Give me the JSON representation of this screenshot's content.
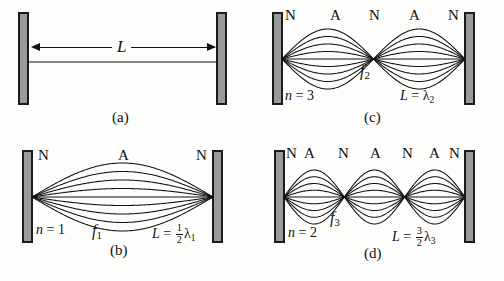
{
  "figure": {
    "background_color": "#fdfdfb",
    "wall_fill_color": "#9a9a9a",
    "wall_border_color": "#1b1b1b",
    "curve_color": "#111111",
    "node_label": "N",
    "antinode_label": "A",
    "length_symbol": "L"
  },
  "panels": [
    {
      "id": "a",
      "tag": "(a)",
      "loops": 0,
      "dimension_label": "L",
      "node_labels": [],
      "harmonic_label": "",
      "frequency_label": "",
      "length_relation": ""
    },
    {
      "id": "b",
      "tag": "(b)",
      "loops": 1,
      "node_labels": [
        "N",
        "A",
        "N"
      ],
      "harmonic_label": "n = 1",
      "harmonic_var": "n",
      "harmonic_value": "1",
      "frequency_label": "f",
      "frequency_sub": "1",
      "length_lhs": "L",
      "length_eq": "=",
      "length_frac_num": "1",
      "length_frac_den": "2",
      "length_lambda": "λ",
      "length_lambda_sub": "1"
    },
    {
      "id": "c",
      "tag": "(c)",
      "loops": 2,
      "node_labels": [
        "N",
        "A",
        "N",
        "A",
        "N"
      ],
      "harmonic_label": "n = 3",
      "harmonic_var": "n",
      "harmonic_value": "3",
      "frequency_label": "f",
      "frequency_sub": "2",
      "length_lhs": "L",
      "length_eq": "=",
      "length_frac_num": "",
      "length_frac_den": "",
      "length_lambda": "λ",
      "length_lambda_sub": "2"
    },
    {
      "id": "d",
      "tag": "(d)",
      "loops": 3,
      "node_labels": [
        "N",
        "A",
        "N",
        "A",
        "N",
        "A",
        "N"
      ],
      "harmonic_label": "n = 2",
      "harmonic_var": "n",
      "harmonic_value": "2",
      "frequency_label": "f",
      "frequency_sub": "3",
      "length_lhs": "L",
      "length_eq": "=",
      "length_frac_num": "3",
      "length_frac_den": "2",
      "length_lambda": "λ",
      "length_lambda_sub": "3"
    }
  ],
  "chart_data": {
    "type": "line",
    "envelope_curves_per_panel": 9,
    "series": [
      {
        "name": "(a) string at rest",
        "loops": 0,
        "n": null,
        "f": null,
        "L_in_wavelengths": null
      },
      {
        "name": "(b) one loop",
        "loops": 1,
        "n": "1",
        "f": "f1",
        "L_in_wavelengths": 0.5
      },
      {
        "name": "(c) two loops",
        "loops": 2,
        "n": "3",
        "f": "f2",
        "L_in_wavelengths": 1.0
      },
      {
        "name": "(d) three loops",
        "loops": 3,
        "n": "2",
        "f": "f3",
        "L_in_wavelengths": 1.5
      }
    ],
    "xlabel": "position along string",
    "ylabel": "transverse displacement",
    "grid": false,
    "legend": "none"
  }
}
